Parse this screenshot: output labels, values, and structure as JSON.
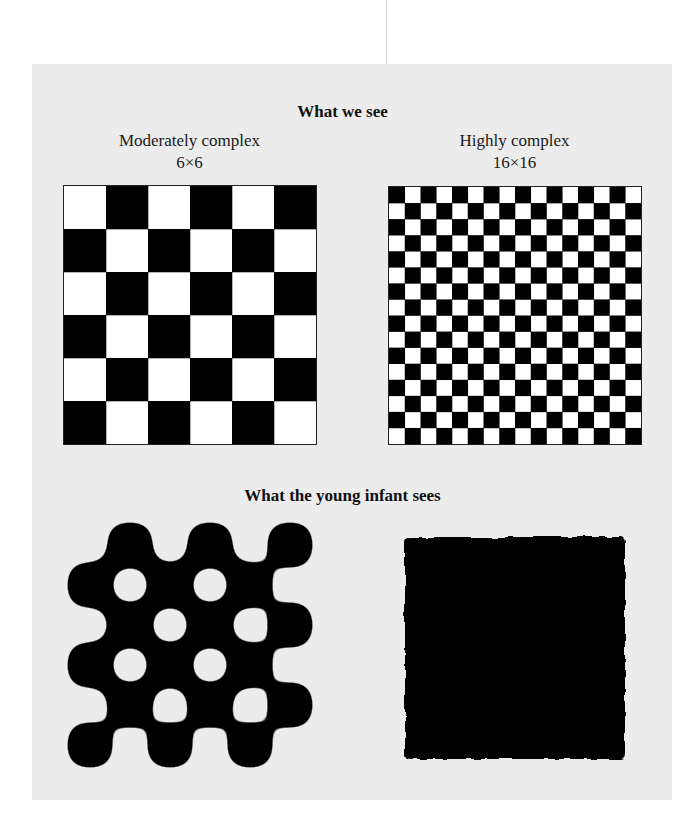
{
  "figure": {
    "top_heading": "What we see",
    "bottom_heading": "What the young infant sees",
    "panels": [
      {
        "label": "Moderately complex",
        "size_label": "6×6",
        "grid": 6,
        "first_cell": "white",
        "infant_view": "blurred checkerboard blobs"
      },
      {
        "label": "Highly complex",
        "size_label": "16×16",
        "grid": 16,
        "first_cell": "black",
        "infant_view": "solid dark square"
      }
    ],
    "colors": {
      "background": "#ececec",
      "black": "#000000",
      "white": "#ffffff"
    }
  }
}
